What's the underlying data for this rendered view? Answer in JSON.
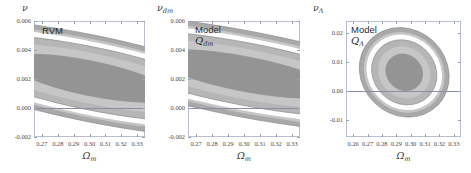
{
  "figure": {
    "kind": "confidence-contour-panels",
    "panel_count": 3,
    "background": "#ffffff",
    "frame_color": "#b9bfd0",
    "zero_line_color": "#8a8f9e",
    "contour_colors": {
      "band_3sigma": "#a9a9a9",
      "band_3sigma_inner": "#c6c6c6",
      "gap_white": "#ffffff",
      "band_2sigma": "#b6b6b6",
      "band_1sigma": "#949494",
      "edge": "#8f8f8f"
    }
  },
  "panels": [
    {
      "id": "rvm",
      "ylabel": "ν",
      "ylabel_sub": "",
      "xlabel": "Ω",
      "xlabel_sub": "m",
      "annotation_line1": "RVM",
      "annotation_line2": "",
      "annotation_line2_sub": "",
      "yticks": [
        "0.006",
        "0.004",
        "0.002",
        "0.000",
        "-0.002"
      ],
      "ytick_values": [
        0.006,
        0.004,
        0.002,
        0.0,
        -0.002
      ],
      "ylim": [
        -0.002,
        0.006
      ],
      "xticks": [
        "0.27",
        "0.28",
        "0.29",
        "0.30",
        "0.31",
        "0.32",
        "0.33"
      ],
      "xtick_values": [
        0.27,
        0.28,
        0.29,
        0.3,
        0.31,
        0.32,
        0.33
      ],
      "xlim": [
        0.265,
        0.335
      ],
      "zero_line_y": 0.0,
      "ellipse": {
        "center_x": 0.3005,
        "center_y": 0.00205,
        "angle_deg": -28,
        "semi_major_1sigma": 0.0123,
        "semi_minor_1sigma": 0.00056,
        "scale_2sigma": 1.82,
        "scale_3sigma": 2.5
      }
    },
    {
      "id": "model-qdm",
      "ylabel": "ν",
      "ylabel_sub": "dm",
      "xlabel": "Ω",
      "xlabel_sub": "m",
      "annotation_line1": "Model",
      "annotation_line2": "Q",
      "annotation_line2_sub": "dm",
      "yticks": [
        "0.006",
        "0.004",
        "0.002",
        "0.000",
        "-0.002"
      ],
      "ytick_values": [
        0.006,
        0.004,
        0.002,
        0.0,
        -0.002
      ],
      "ylim": [
        -0.002,
        0.006
      ],
      "xticks": [
        "0.27",
        "0.28",
        "0.29",
        "0.30",
        "0.31",
        "0.32",
        "0.33"
      ],
      "xtick_values": [
        0.27,
        0.28,
        0.29,
        0.3,
        0.31,
        0.32,
        0.33
      ],
      "xlim": [
        0.265,
        0.335
      ],
      "zero_line_y": 0.0,
      "ellipse": {
        "center_x": 0.3005,
        "center_y": 0.00235,
        "angle_deg": -30,
        "semi_major_1sigma": 0.0125,
        "semi_minor_1sigma": 0.00062,
        "scale_2sigma": 1.8,
        "scale_3sigma": 2.48
      }
    },
    {
      "id": "model-qlambda",
      "ylabel": "ν",
      "ylabel_sub": "Λ",
      "xlabel": "Ω",
      "xlabel_sub": "m",
      "annotation_line1": "Model",
      "annotation_line2": "Q",
      "annotation_line2_sub": "Λ",
      "yticks": [
        "0.02",
        "0.01",
        "0.00",
        "-0.01"
      ],
      "ytick_values": [
        0.02,
        0.01,
        0.0,
        -0.01
      ],
      "ylim": [
        -0.016,
        0.024
      ],
      "xticks": [
        "0.26",
        "0.27",
        "0.28",
        "0.29",
        "0.30",
        "0.31",
        "0.32",
        "0.33"
      ],
      "xtick_values": [
        0.26,
        0.27,
        0.28,
        0.29,
        0.3,
        0.31,
        0.32,
        0.33
      ],
      "xlim": [
        0.255,
        0.335
      ],
      "zero_line_y": 0.0,
      "ellipse": {
        "center_x": 0.2955,
        "center_y": 0.0063,
        "angle_deg": -27,
        "semi_major_1sigma": 0.0135,
        "semi_minor_1sigma": 0.0028,
        "scale_2sigma": 1.78,
        "scale_3sigma": 2.45
      }
    }
  ],
  "chart_data": {
    "type": "scatter",
    "title": "",
    "panels": [
      {
        "name": "RVM",
        "xlabel": "Ω_m",
        "ylabel": "ν",
        "xlim": [
          0.265,
          0.335
        ],
        "ylim": [
          -0.002,
          0.006
        ],
        "xticks": [
          0.27,
          0.28,
          0.29,
          0.3,
          0.31,
          0.32,
          0.33
        ],
        "yticks": [
          -0.002,
          0.0,
          0.002,
          0.004,
          0.006
        ],
        "best_fit": {
          "x": 0.3005,
          "y": 0.00205
        },
        "contours": [
          "1-sigma",
          "2-sigma",
          "3-sigma"
        ],
        "correlation": "positive, tilted ellipse",
        "grid": false,
        "legend": "none",
        "annotation": "RVM"
      },
      {
        "name": "Model Q_dm",
        "xlabel": "Ω_m",
        "ylabel": "ν_dm",
        "xlim": [
          0.265,
          0.335
        ],
        "ylim": [
          -0.002,
          0.006
        ],
        "xticks": [
          0.27,
          0.28,
          0.29,
          0.3,
          0.31,
          0.32,
          0.33
        ],
        "yticks": [
          -0.002,
          0.0,
          0.002,
          0.004,
          0.006
        ],
        "best_fit": {
          "x": 0.3005,
          "y": 0.00235
        },
        "contours": [
          "1-sigma",
          "2-sigma",
          "3-sigma"
        ],
        "correlation": "positive, tilted ellipse",
        "grid": false,
        "legend": "none",
        "annotation": "Model Q_dm"
      },
      {
        "name": "Model Q_Lambda",
        "xlabel": "Ω_m",
        "ylabel": "ν_Λ",
        "xlim": [
          0.255,
          0.335
        ],
        "ylim": [
          -0.016,
          0.024
        ],
        "xticks": [
          0.26,
          0.27,
          0.28,
          0.29,
          0.3,
          0.31,
          0.32,
          0.33
        ],
        "yticks": [
          -0.01,
          0.0,
          0.01,
          0.02
        ],
        "best_fit": {
          "x": 0.2955,
          "y": 0.0063
        },
        "contours": [
          "1-sigma",
          "2-sigma",
          "3-sigma"
        ],
        "correlation": "positive, tilted ellipse",
        "grid": false,
        "legend": "none",
        "annotation": "Model Q_Λ"
      }
    ]
  }
}
